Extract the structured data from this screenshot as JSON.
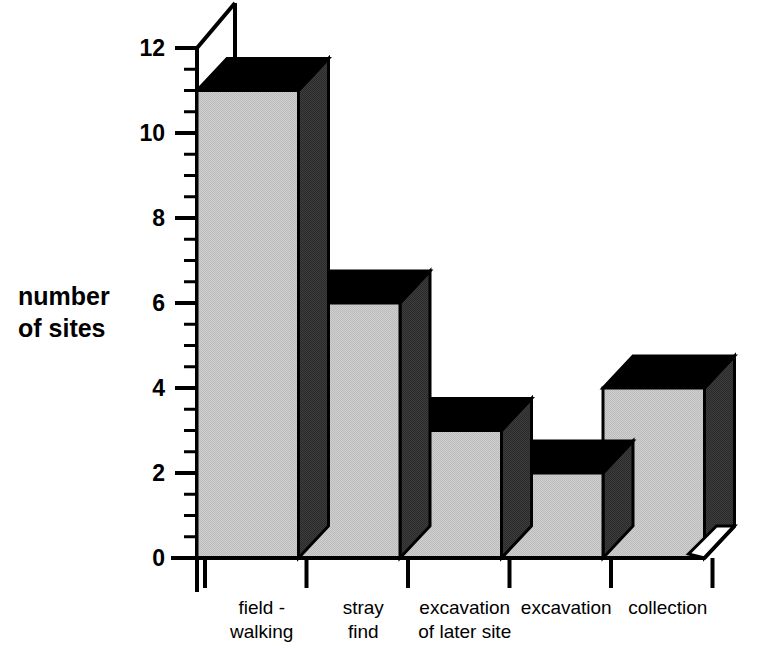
{
  "chart_data": {
    "type": "bar",
    "title": "",
    "subtitle": "",
    "xlabel": "",
    "ylabel": "number\nof sites",
    "ylabel_line1": "number",
    "ylabel_line2": "of sites",
    "categories": [
      "field -\nwalking",
      "stray\nfind",
      "excavation\nof later site",
      "excavation",
      "collection"
    ],
    "category_lines": [
      [
        "field -",
        "walking"
      ],
      [
        "stray",
        "find"
      ],
      [
        "excavation",
        "of later site"
      ],
      [
        "excavation",
        ""
      ],
      [
        "collection",
        ""
      ]
    ],
    "values": [
      11,
      6,
      3,
      2,
      4
    ],
    "ylim": [
      0,
      12
    ],
    "ytick_values": [
      0,
      2,
      4,
      6,
      8,
      10,
      12
    ],
    "ytick_labels": [
      "0",
      "2",
      "4",
      "6",
      "8",
      "10",
      "12"
    ],
    "yminor_step": 0.5,
    "grid": false,
    "legend": null,
    "style": "3d-bar",
    "colors": {
      "bar_front": "#c6c6c6",
      "bar_side": "#3a3a3a",
      "bar_top": "#000000",
      "axis": "#000000",
      "background": "#ffffff"
    }
  }
}
